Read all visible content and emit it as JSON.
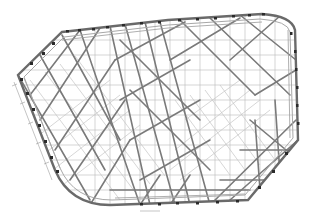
{
  "drawing": {
    "type": "structural-roof-plan",
    "description": "Steel space-truss roof framing plan",
    "colors": {
      "background": "#ffffff",
      "primary_member": "#7a7a7a",
      "secondary_member": "#9a9a9a",
      "grid": "#b8b8b8",
      "support_node": "#2a2a2a"
    },
    "outline_vertices": [
      [
        62,
        32
      ],
      [
        168,
        20
      ],
      [
        262,
        14
      ],
      [
        295,
        30
      ],
      [
        298,
        140
      ],
      [
        248,
        200
      ],
      [
        110,
        205
      ],
      [
        18,
        75
      ]
    ],
    "labels": {
      "bottom_dimension_tag": "",
      "member_marks": [
        "",
        "",
        "",
        "",
        ""
      ]
    }
  }
}
